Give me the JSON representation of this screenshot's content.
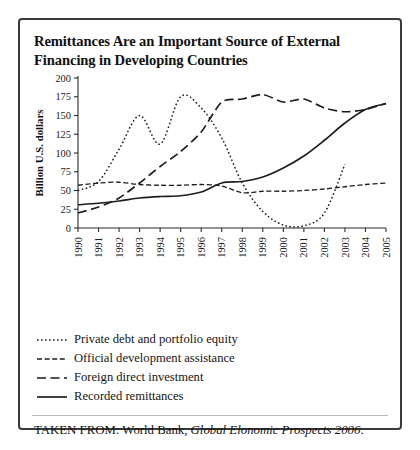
{
  "figure": {
    "title": "Remittances Are an Important Source of External Financing in Developing Countries",
    "source_prefix": "TAKEN FROM: World Bank,",
    "source_italic": "Global Elonomic Prospects 2006",
    "source_suffix": "."
  },
  "chart_data": {
    "type": "line",
    "title": "Remittances Are an Important Source of External Financing in Developing Countries",
    "xlabel": "",
    "ylabel": "Billion U.S. dollars",
    "categories": [
      "1990",
      "1991",
      "1992",
      "1993",
      "1994",
      "1995",
      "1996",
      "1997",
      "1998",
      "1999",
      "2000",
      "2001",
      "2002",
      "2003",
      "2004",
      "2005"
    ],
    "x": [
      1990,
      1991,
      1992,
      1993,
      1994,
      1995,
      1996,
      1997,
      1998,
      1999,
      2000,
      2001,
      2002,
      2003,
      2004,
      2005
    ],
    "xlim": [
      1990,
      2005
    ],
    "ylim": [
      0,
      200
    ],
    "yticks": [
      0,
      25,
      50,
      75,
      100,
      125,
      150,
      175,
      200
    ],
    "grid": false,
    "legend_position": "below-plot",
    "series": [
      {
        "name": "Private debt and portfolio equity",
        "style": "dotted",
        "x": [
          1990,
          1991,
          1992,
          1993,
          1994,
          1995,
          1996,
          1997,
          1998,
          1999,
          2000,
          2001,
          2002,
          2003
        ],
        "values": [
          50,
          62,
          105,
          150,
          112,
          175,
          160,
          120,
          60,
          22,
          4,
          3,
          20,
          85
        ]
      },
      {
        "name": "Official development assistance",
        "style": "dash-dot-short",
        "x": [
          1990,
          1991,
          1992,
          1993,
          1994,
          1995,
          1996,
          1997,
          1998,
          1999,
          2000,
          2001,
          2002,
          2003,
          2004,
          2005
        ],
        "values": [
          57,
          60,
          61,
          58,
          57,
          57,
          58,
          56,
          47,
          49,
          49,
          50,
          52,
          55,
          58,
          60
        ]
      },
      {
        "name": "Foreign direct investment",
        "style": "dash-long",
        "x": [
          1990,
          1991,
          1992,
          1993,
          1994,
          1995,
          1996,
          1997,
          1998,
          1999,
          2000,
          2001,
          2002,
          2003,
          2004,
          2005
        ],
        "values": [
          20,
          28,
          40,
          60,
          82,
          102,
          128,
          168,
          172,
          178,
          168,
          172,
          160,
          155,
          158,
          166
        ]
      },
      {
        "name": "Recorded remittances",
        "style": "solid",
        "x": [
          1990,
          1991,
          1992,
          1993,
          1994,
          1995,
          1996,
          1997,
          1998,
          1999,
          2000,
          2001,
          2002,
          2003,
          2004,
          2005
        ],
        "values": [
          31,
          33,
          36,
          40,
          42,
          43,
          48,
          60,
          62,
          68,
          80,
          96,
          117,
          140,
          158,
          166
        ]
      }
    ]
  },
  "legend": {
    "items": [
      {
        "label": "Private debt and portfolio equity",
        "style": "dotted"
      },
      {
        "label": "Official development assistance",
        "style": "dash-dot-short"
      },
      {
        "label": "Foreign direct investment",
        "style": "dash-long"
      },
      {
        "label": "Recorded remittances",
        "style": "solid"
      }
    ]
  }
}
